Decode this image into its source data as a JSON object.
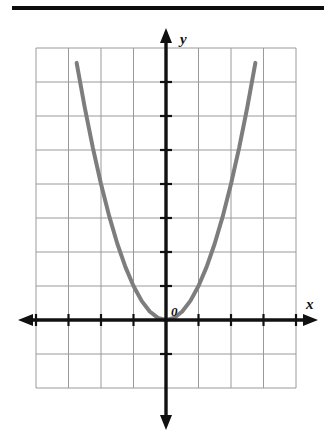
{
  "figure": {
    "title_rule": "horizontal-divider",
    "background_color": "#ffffff"
  },
  "labels": {
    "x_axis": "x",
    "y_axis": "y",
    "origin": "0"
  },
  "colors": {
    "curve": "#7d7d7d",
    "axis": "#111111",
    "grid": "#9a9a9a",
    "grid_border": "#8a8a8a",
    "rule": "#0d0d0d"
  },
  "chart_data": {
    "type": "line",
    "title": "",
    "subtitle": "",
    "xlabel": "x",
    "ylabel": "y",
    "grid": true,
    "legend": "none",
    "annotations": [
      {
        "text": "0",
        "x": 0.35,
        "y": 0.45,
        "note": "origin label"
      }
    ],
    "xlim": [
      -4,
      4
    ],
    "ylim": [
      -2,
      8
    ],
    "xticks": [
      -4,
      -3,
      -2,
      -1,
      0,
      1,
      2,
      3,
      4
    ],
    "yticks": [
      -2,
      -1,
      0,
      1,
      2,
      3,
      4,
      5,
      6,
      7,
      8
    ],
    "tick_labels_shown": false,
    "grid_columns": 8,
    "grid_rows": 10,
    "series": [
      {
        "name": "y = x^2",
        "equation": "y = x^2",
        "vertex": [
          0,
          0
        ],
        "opens": "up",
        "color": "#7d7d7d",
        "line_width": 4,
        "x": [
          -2.75,
          -2.5,
          -2.25,
          -2.0,
          -1.75,
          -1.5,
          -1.25,
          -1.0,
          -0.75,
          -0.5,
          -0.25,
          0,
          0.25,
          0.5,
          0.75,
          1.0,
          1.25,
          1.5,
          1.75,
          2.0,
          2.25,
          2.5,
          2.75
        ],
        "values": [
          7.5625,
          6.25,
          5.0625,
          4.0,
          3.0625,
          2.25,
          1.5625,
          1.0,
          0.5625,
          0.25,
          0.0625,
          0,
          0.0625,
          0.25,
          0.5625,
          1.0,
          1.5625,
          2.25,
          3.0625,
          4.0,
          5.0625,
          6.25,
          7.5625
        ]
      }
    ]
  }
}
